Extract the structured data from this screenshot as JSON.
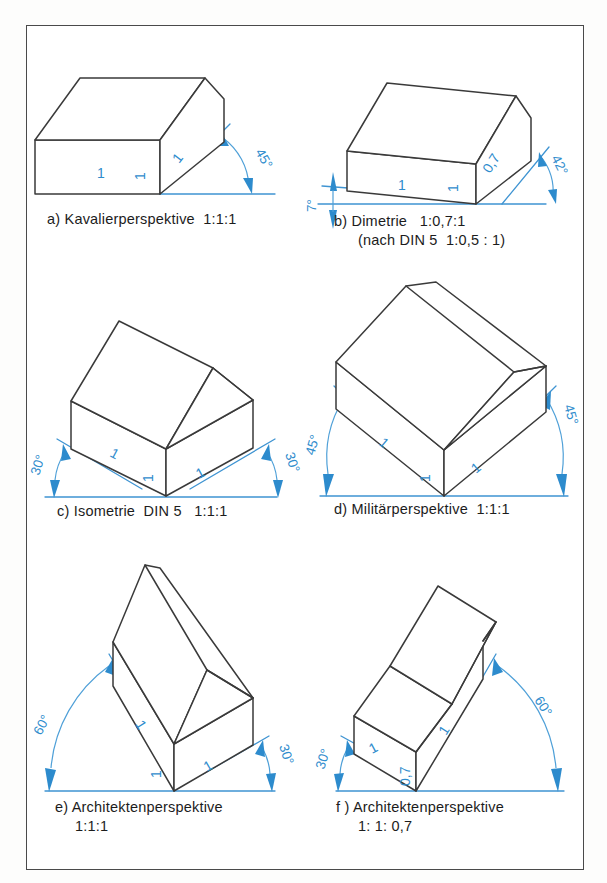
{
  "figure": {
    "frame_color": "#4a4a4a",
    "line_color": "#3a3a3a",
    "annotation_color": "#2f8ccd"
  },
  "panels": [
    {
      "id": "a",
      "caption_lines": [
        "a) Kavalierperspektive  1:1:1"
      ],
      "label": "a)",
      "name": "Kavalierperspektive",
      "ratio": "1:1:1",
      "angles": [
        "45°"
      ],
      "dimensions": [
        "1",
        "1",
        "1"
      ],
      "dim_width": "1",
      "dim_height": "1",
      "dim_depth": "1"
    },
    {
      "id": "b",
      "caption_lines": [
        "b) Dimetrie   1:0,7:1",
        "(nach DIN 5  1:0,5 : 1)"
      ],
      "label": "b)",
      "name": "Dimetrie",
      "ratio": "1:0,7:1",
      "standard_note": "(nach DIN 5  1:0,5 : 1)",
      "angles": [
        "7°",
        "42°"
      ],
      "dimensions": [
        "1",
        "1",
        "0,7"
      ],
      "dim_width": "1",
      "dim_height": "1",
      "dim_depth": "0,7"
    },
    {
      "id": "c",
      "caption_lines": [
        "c) Isometrie  DIN 5   1:1:1"
      ],
      "label": "c)",
      "name": "Isometrie  DIN 5",
      "ratio": "1:1:1",
      "angles": [
        "30°",
        "30°"
      ],
      "dimensions": [
        "1",
        "1",
        "1"
      ],
      "dim_width": "1",
      "dim_height": "1",
      "dim_depth": "1"
    },
    {
      "id": "d",
      "caption_lines": [
        "d) Militärperspektive  1:1:1"
      ],
      "label": "d)",
      "name": "Militärperspektive",
      "ratio": "1:1:1",
      "angles": [
        "45°",
        "45°"
      ],
      "dimensions": [
        "1",
        "1",
        "1"
      ],
      "dim_width": "1",
      "dim_height": "1",
      "dim_depth": "1"
    },
    {
      "id": "e",
      "caption_lines": [
        "e) Architektenperspektive",
        "1:1:1"
      ],
      "label": "e)",
      "name": "Architektenperspektive",
      "ratio": "1:1:1",
      "angles": [
        "60°",
        "30°"
      ],
      "dimensions": [
        "1",
        "1",
        "1"
      ],
      "dim_width": "1",
      "dim_height": "1",
      "dim_depth": "1"
    },
    {
      "id": "f",
      "caption_lines": [
        "f ) Architektenperspektive",
        "1: 1: 0,7"
      ],
      "label": "f )",
      "name": "Architektenperspektive",
      "ratio": "1: 1: 0,7",
      "angles": [
        "30°",
        "60°"
      ],
      "dimensions": [
        "1",
        "1",
        "0,7"
      ],
      "dim_width": "1",
      "dim_height": "1",
      "dim_depth": "0,7"
    }
  ]
}
